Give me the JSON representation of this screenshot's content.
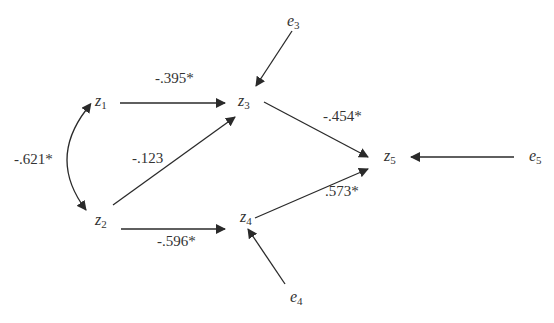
{
  "diagram": {
    "type": "path-diagram",
    "colors": {
      "line": "#2a2a2a",
      "text": "#333333",
      "background": "#ffffff"
    },
    "nodes": [
      {
        "id": "z1",
        "letter": "z",
        "sub": "1"
      },
      {
        "id": "z2",
        "letter": "z",
        "sub": "2"
      },
      {
        "id": "z3",
        "letter": "z",
        "sub": "3"
      },
      {
        "id": "z4",
        "letter": "z",
        "sub": "4"
      },
      {
        "id": "z5",
        "letter": "z",
        "sub": "5"
      },
      {
        "id": "e3",
        "letter": "e",
        "sub": "3"
      },
      {
        "id": "e4",
        "letter": "e",
        "sub": "4"
      },
      {
        "id": "e5",
        "letter": "e",
        "sub": "5"
      }
    ],
    "edges": [
      {
        "from": "z1",
        "to": "z2",
        "kind": "bidirectional-curve",
        "label": "-.621*"
      },
      {
        "from": "z1",
        "to": "z3",
        "label": "-.395*"
      },
      {
        "from": "z2",
        "to": "z3",
        "label": "-.123"
      },
      {
        "from": "z2",
        "to": "z4",
        "label": "-.596*"
      },
      {
        "from": "z3",
        "to": "z5",
        "label": "-.454*"
      },
      {
        "from": "z4",
        "to": "z5",
        "label": ".573*"
      },
      {
        "from": "e3",
        "to": "z3",
        "label": ""
      },
      {
        "from": "e4",
        "to": "z4",
        "label": ""
      },
      {
        "from": "e5",
        "to": "z5",
        "label": ""
      }
    ]
  }
}
